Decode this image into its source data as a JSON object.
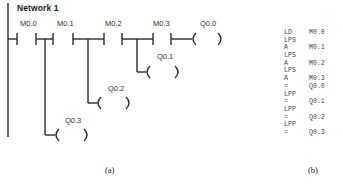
{
  "ladder": {
    "network_title": "Network 1",
    "contacts": [
      {
        "label": "M0.0"
      },
      {
        "label": "M0.1"
      },
      {
        "label": "M0.2"
      },
      {
        "label": "M0.3"
      }
    ],
    "coils": [
      {
        "label": "Q0.0"
      },
      {
        "label": "Q0.1"
      },
      {
        "label": "Q0.2"
      },
      {
        "label": "Q0.3"
      }
    ],
    "caption": "(a)"
  },
  "statement_list": {
    "rows": [
      {
        "op": "LD",
        "arg": "M0.0"
      },
      {
        "op": "LPS",
        "arg": ""
      },
      {
        "op": "A",
        "arg": "M0.1"
      },
      {
        "op": "LPS",
        "arg": ""
      },
      {
        "op": "A",
        "arg": "M0.2"
      },
      {
        "op": "LPS",
        "arg": ""
      },
      {
        "op": "A",
        "arg": "M0.3"
      },
      {
        "op": "=",
        "arg": "Q0.0"
      },
      {
        "op": "LPP",
        "arg": ""
      },
      {
        "op": "=",
        "arg": "Q0.1"
      },
      {
        "op": "LPP",
        "arg": ""
      },
      {
        "op": "=",
        "arg": "Q0.2"
      },
      {
        "op": "LPP",
        "arg": ""
      },
      {
        "op": "=",
        "arg": "Q0.3"
      }
    ],
    "caption": "(b)"
  },
  "colors": {
    "line": "#2a2a2a",
    "background": "#ffffff"
  }
}
